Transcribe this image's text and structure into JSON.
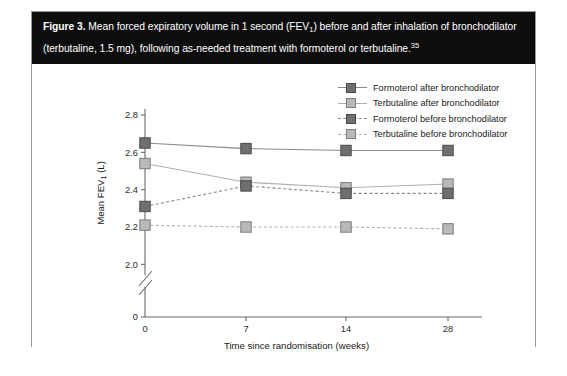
{
  "caption": {
    "figure_label": "Figure 3.",
    "text_part1": "Mean forced expiratory volume in 1 second (FEV",
    "sub1": "1",
    "text_part2": ") before and after inhalation of bronchodilator (terbutaline, 1.5 mg), following as-needed treatment with formoterol or terbutaline.",
    "reference": "35"
  },
  "colors": {
    "dark_marker_fill": "#6f6f6f",
    "dark_marker_stroke": "#4a4a4a",
    "light_marker_fill": "#b9b9b9",
    "light_marker_stroke": "#7d7d7d",
    "dark_line": "#8a8a8a",
    "light_line": "#b0b0b0",
    "axis": "#6b6b6b",
    "caption_bg": "#0d0d0d",
    "frame_border": "#9a9a9a"
  },
  "legend": {
    "items": [
      {
        "label": "Formoterol after bronchodilator",
        "tone": "dark",
        "dash": false
      },
      {
        "label": "Terbutaline after bronchodilator",
        "tone": "light",
        "dash": false
      },
      {
        "label": "Formoterol before bronchodilator",
        "tone": "dark",
        "dash": true
      },
      {
        "label": "Terbutaline before bronchodilator",
        "tone": "light",
        "dash": true
      }
    ]
  },
  "chart_data": {
    "type": "line",
    "title": "",
    "xlabel": "Time since randomisation (weeks)",
    "ylabel": "Mean FEV1 (L)",
    "ylabel_main": "Mean FEV",
    "ylabel_sub": "1",
    "ylabel_unit": " (L)",
    "x": [
      0,
      7,
      14,
      28
    ],
    "xticklabels": [
      "0",
      "7",
      "14",
      "28"
    ],
    "yticklabels": [
      "0",
      "2.0",
      "2.2",
      "2.4",
      "2.6",
      "2.8"
    ],
    "ylim": [
      2.0,
      2.8
    ],
    "y_axis_break": true,
    "y_break_label": "0",
    "grid": false,
    "legend_position": "top-right",
    "series": [
      {
        "name": "Formoterol after bronchodilator",
        "tone": "dark",
        "dash": false,
        "values": [
          2.65,
          2.62,
          2.61,
          2.61
        ]
      },
      {
        "name": "Terbutaline after bronchodilator",
        "tone": "light",
        "dash": false,
        "values": [
          2.54,
          2.44,
          2.41,
          2.43
        ]
      },
      {
        "name": "Formoterol before bronchodilator",
        "tone": "dark",
        "dash": true,
        "values": [
          2.31,
          2.42,
          2.38,
          2.38
        ]
      },
      {
        "name": "Terbutaline before bronchodilator",
        "tone": "light",
        "dash": true,
        "values": [
          2.21,
          2.2,
          2.2,
          2.19
        ]
      }
    ]
  }
}
